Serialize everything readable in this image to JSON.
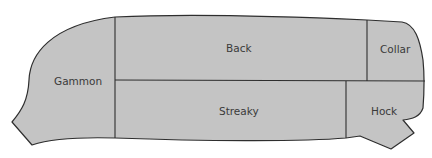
{
  "diagram": {
    "title": "",
    "colors": {
      "fill": "#c4c4c4",
      "line": "#2e2e2e",
      "text": "#3a3a3a",
      "background": "#ffffff"
    },
    "cuts": [
      {
        "id": "gammon",
        "label": "Gammon"
      },
      {
        "id": "back",
        "label": "Back"
      },
      {
        "id": "collar",
        "label": "Collar"
      },
      {
        "id": "streaky",
        "label": "Streaky"
      },
      {
        "id": "hock",
        "label": "Hock"
      }
    ]
  }
}
